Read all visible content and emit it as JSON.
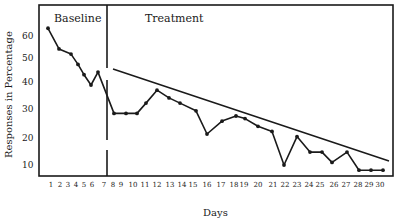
{
  "chart_data": {
    "type": "line",
    "title": "",
    "xlabel": "Days",
    "ylabel": "Responses in Percentage",
    "x": [
      1,
      2,
      3,
      4,
      5,
      6,
      7,
      8,
      9,
      10,
      11,
      12,
      13,
      14,
      15,
      16,
      17,
      18,
      19,
      20,
      21,
      22,
      23,
      24,
      25,
      26,
      27,
      28,
      29,
      30
    ],
    "x_tick_labels": [
      "1",
      "2",
      "3",
      "4",
      "5",
      "6",
      "7",
      "8",
      "9",
      "10",
      "11",
      "12",
      "13",
      "14",
      "15",
      "16",
      "17",
      "18",
      "19",
      "20",
      "21",
      "22",
      "23",
      "24",
      "25",
      "26",
      "27",
      "28",
      "29",
      "30"
    ],
    "y_tick_labels": [
      "10",
      "20",
      "30",
      "40",
      "50",
      "60"
    ],
    "y_ticks": [
      10,
      20,
      30,
      40,
      50,
      60
    ],
    "ylim": [
      3,
      66
    ],
    "xlim": [
      0.5,
      30.8
    ],
    "grid": false,
    "legend": null,
    "phases": [
      {
        "label": "Baseline",
        "days": [
          1,
          7
        ]
      },
      {
        "label": "Treatment",
        "days": [
          8,
          30
        ]
      }
    ],
    "phase_divider_after_day": 7.5,
    "series": [
      {
        "name": "Baseline",
        "x": [
          1,
          2,
          3,
          4,
          5,
          6,
          7
        ],
        "values": [
          63,
          55,
          53,
          49,
          45,
          41,
          46
        ]
      },
      {
        "name": "Treatment",
        "x": [
          8,
          9,
          10,
          11,
          12,
          13,
          14,
          15,
          16,
          17,
          18,
          19,
          20,
          21,
          22,
          23,
          24,
          25,
          26,
          27,
          28,
          29,
          30
        ],
        "values": [
          30,
          30,
          30,
          34,
          39,
          36,
          34,
          31,
          22,
          27,
          29,
          28,
          25,
          23,
          10,
          21,
          15,
          15,
          11,
          15,
          8,
          8,
          8
        ]
      }
    ],
    "annotations": [
      {
        "type": "trend_line",
        "label": "Treatment trend",
        "from": {
          "x": 8,
          "y": 46
        },
        "to": {
          "x": 30.7,
          "y": 13
        }
      }
    ]
  },
  "labels": {
    "baseline": "Baseline",
    "treatment": "Treatment",
    "xlabel": "Days",
    "ylabel": "Responses in Percentage"
  }
}
